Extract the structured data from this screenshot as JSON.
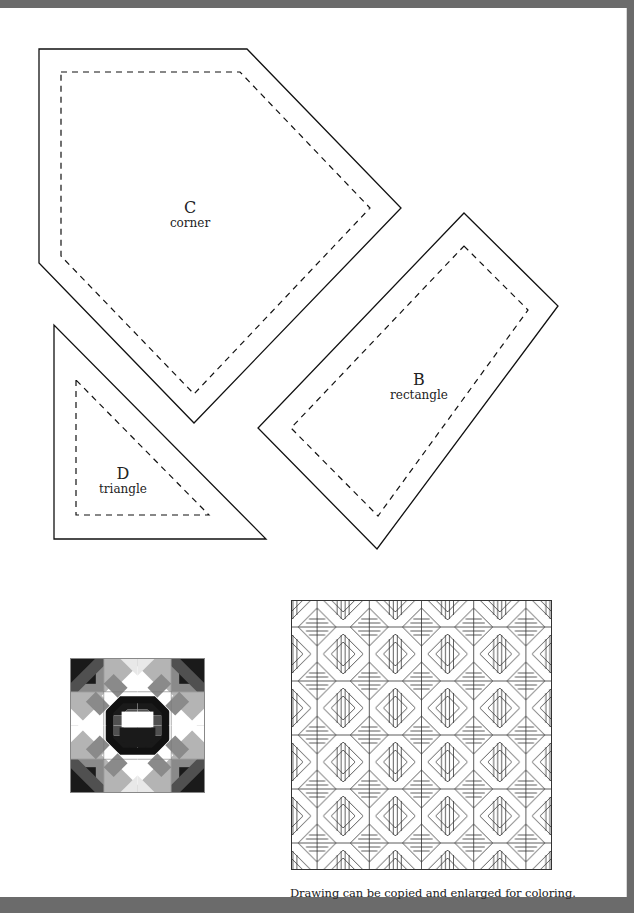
{
  "page": {
    "background_color": "#ffffff",
    "frame_color": "#6b6b6b"
  },
  "templates": [
    {
      "id": "C",
      "letter": "C",
      "name": "corner",
      "shape": "pentagon"
    },
    {
      "id": "B",
      "letter": "B",
      "name": "rectangle",
      "shape": "rotated-rectangle"
    },
    {
      "id": "D",
      "letter": "D",
      "name": "triangle",
      "shape": "right-triangle"
    }
  ],
  "line_styles": {
    "cut_line": "solid",
    "seam_line": "dashed"
  },
  "illustrations": {
    "color_block": {
      "description": "shaded quilt block sample",
      "grid": "2x2",
      "shades": [
        "#1a1a1a",
        "#505050",
        "#8a8a8a",
        "#b4b4b4",
        "#ffffff"
      ]
    },
    "line_drawing": {
      "description": "quilt layout line drawing",
      "grid": "5x5"
    }
  },
  "caption": "Drawing can be copied and enlarged for coloring."
}
